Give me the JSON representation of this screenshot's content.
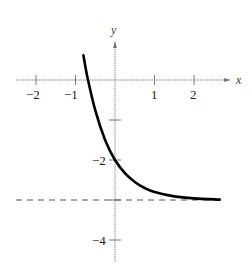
{
  "chart_data": {
    "type": "line",
    "title": "",
    "xlabel": "x",
    "ylabel": "y",
    "xlim": [
      -2.5,
      2.9
    ],
    "ylim": [
      -4.5,
      1.2
    ],
    "x_ticks": [
      -2,
      -1,
      1,
      2
    ],
    "x_tick_labels": [
      "−2",
      "−1",
      "1",
      "2"
    ],
    "y_ticks": [
      -1,
      -2,
      -3,
      -4
    ],
    "y_tick_labels": [
      "",
      "−2",
      "",
      "−4"
    ],
    "grid": false,
    "legend": null,
    "series": [
      {
        "name": "curve",
        "style": "solid",
        "color": "#000000",
        "x": [
          -0.8,
          -0.7,
          -0.5,
          -0.25,
          0,
          0.25,
          0.5,
          0.75,
          1,
          1.5,
          2,
          2.65
        ],
        "y": [
          0.62,
          0.08,
          -0.76,
          -1.5,
          -2.0,
          -2.33,
          -2.55,
          -2.7,
          -2.8,
          -2.91,
          -2.96,
          -2.99
        ]
      },
      {
        "name": "horizontal asymptote y = -3",
        "style": "dashed",
        "color": "#555555",
        "x": [
          -2.5,
          2.65
        ],
        "y": [
          -3,
          -3
        ]
      }
    ],
    "annotations": [
      {
        "text": "y = -3 (horizontal asymptote)",
        "type": "dashed-line"
      }
    ]
  },
  "labels": {
    "x_axis": "x",
    "y_axis": "y",
    "tick_x_m2": "−2",
    "tick_x_m1": "−1",
    "tick_x_1": "1",
    "tick_x_2": "2",
    "tick_y_m2": "−2",
    "tick_y_m4": "−4"
  },
  "colors": {
    "curve": "#000000",
    "axes": "#777777",
    "asymptote": "#555555"
  }
}
